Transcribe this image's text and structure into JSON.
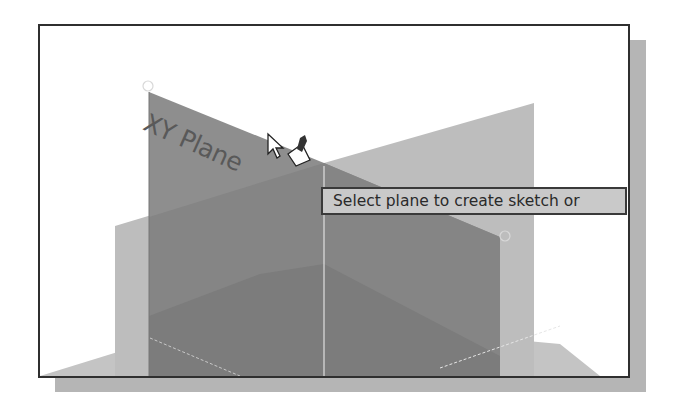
{
  "viewport": {
    "planes": [
      {
        "name": "XY Plane",
        "label": "XY Plane",
        "state": "highlighted"
      },
      {
        "name": "YZ Plane",
        "label": "",
        "state": "default"
      },
      {
        "name": "ZX Plane",
        "label": "",
        "state": "default"
      }
    ],
    "tooltip": "Select plane to create sketch or",
    "cursor": "select-plane-cursor",
    "colors": {
      "background": "#ffffff",
      "frame": "#2f2f2f",
      "shadow": "#b5b5b5",
      "highlighted_plane": "#8c8c8c",
      "light_plane": "#bdbdbd",
      "tooltip_bg": "#c9c9c9"
    }
  }
}
